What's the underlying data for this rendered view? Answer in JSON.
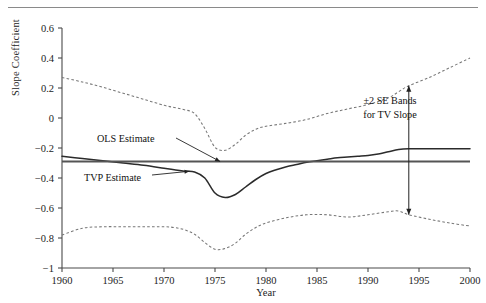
{
  "figure": {
    "has_top_rule": true,
    "background": "#ffffff"
  },
  "axis": {
    "ylabel": "Slope Coefficient",
    "xlabel": "Year",
    "y_ticks": [
      "0.6",
      "0.4",
      "0.2",
      "0",
      "−0.2",
      "−0.4",
      "−0.6",
      "−0.8",
      "−1"
    ],
    "x_ticks": [
      "1960",
      "1965",
      "1970",
      "1975",
      "1980",
      "1985",
      "1990",
      "1995",
      "2000"
    ]
  },
  "annotations": {
    "ols": "OLS Estimate",
    "tvp": "TVP Estimate",
    "se_line1": "±2 SE Bands",
    "se_line2": "for TV Slope"
  },
  "colors": {
    "solid_line": "#2b2b2b",
    "ols_line": "#555555",
    "dashed_band": "#777777",
    "axis": "#4a4a4a",
    "text": "#1c1c1c"
  },
  "chart_data": {
    "type": "line",
    "title": "",
    "xlabel": "Year",
    "ylabel": "Slope Coefficient",
    "xlim": [
      1960,
      2000
    ],
    "ylim": [
      -1,
      0.6
    ],
    "ytick_values": [
      0.6,
      0.4,
      0.2,
      0,
      -0.2,
      -0.4,
      -0.6,
      -0.8,
      -1
    ],
    "xtick_values": [
      1960,
      1965,
      1970,
      1975,
      1980,
      1985,
      1990,
      1995,
      2000
    ],
    "grid": false,
    "legend": "none (inline text annotations)",
    "series": [
      {
        "name": "OLS Estimate",
        "style": "solid-thick-flat",
        "color": "#555555",
        "x": [
          1960,
          2000
        ],
        "values": [
          -0.29,
          -0.29
        ]
      },
      {
        "name": "TVP Estimate",
        "style": "solid",
        "color": "#2b2b2b",
        "x": [
          1960,
          1962,
          1964,
          1966,
          1968,
          1970,
          1971,
          1972,
          1973,
          1974,
          1975,
          1976,
          1977,
          1978,
          1979,
          1980,
          1981,
          1982,
          1983,
          1984,
          1985,
          1986,
          1987,
          1988,
          1989,
          1990,
          1991,
          1992,
          1993,
          1994,
          1996,
          1998,
          2000
        ],
        "values": [
          -0.255,
          -0.27,
          -0.285,
          -0.3,
          -0.315,
          -0.335,
          -0.345,
          -0.355,
          -0.36,
          -0.4,
          -0.5,
          -0.53,
          -0.51,
          -0.46,
          -0.41,
          -0.37,
          -0.345,
          -0.325,
          -0.31,
          -0.295,
          -0.285,
          -0.275,
          -0.265,
          -0.26,
          -0.255,
          -0.25,
          -0.24,
          -0.225,
          -0.21,
          -0.205,
          -0.205,
          -0.205,
          -0.205
        ]
      },
      {
        "name": "Upper +2 SE Band",
        "style": "dashed",
        "color": "#777777",
        "x": [
          1960,
          1962,
          1964,
          1966,
          1968,
          1970,
          1971,
          1972,
          1973,
          1974,
          1975,
          1976,
          1977,
          1978,
          1979,
          1980,
          1982,
          1984,
          1986,
          1988,
          1990,
          1992,
          1993,
          1994,
          1996,
          1998,
          2000
        ],
        "values": [
          0.27,
          0.24,
          0.205,
          0.165,
          0.125,
          0.085,
          0.07,
          0.055,
          0.03,
          -0.07,
          -0.195,
          -0.215,
          -0.175,
          -0.115,
          -0.075,
          -0.055,
          -0.035,
          -0.01,
          0.03,
          0.06,
          0.09,
          0.135,
          0.175,
          0.215,
          0.27,
          0.335,
          0.4
        ]
      },
      {
        "name": "Lower -2 SE Band",
        "style": "dashed",
        "color": "#777777",
        "x": [
          1960,
          1962,
          1964,
          1966,
          1968,
          1970,
          1971,
          1972,
          1973,
          1974,
          1975,
          1976,
          1977,
          1978,
          1979,
          1980,
          1982,
          1984,
          1986,
          1988,
          1990,
          1992,
          1993,
          1994,
          1996,
          1998,
          2000
        ],
        "values": [
          -0.78,
          -0.735,
          -0.725,
          -0.725,
          -0.725,
          -0.725,
          -0.73,
          -0.745,
          -0.775,
          -0.83,
          -0.875,
          -0.87,
          -0.835,
          -0.775,
          -0.73,
          -0.7,
          -0.665,
          -0.645,
          -0.645,
          -0.66,
          -0.645,
          -0.625,
          -0.62,
          -0.645,
          -0.675,
          -0.7,
          -0.72
        ]
      }
    ],
    "annotations": [
      {
        "text": "OLS Estimate",
        "x": 1970.5,
        "y": -0.22,
        "points_to": [
          1975.5,
          -0.29
        ]
      },
      {
        "text": "TVP Estimate",
        "x": 1966.5,
        "y": -0.46,
        "points_to": [
          1972.5,
          -0.355
        ]
      },
      {
        "text": "±2 SE Bands for TV Slope",
        "x": 1994,
        "y": 0.06,
        "arrow_from": [
          1994,
          0.215
        ],
        "arrow_to": [
          1994,
          -0.645
        ],
        "arrow": "double-headed"
      }
    ]
  }
}
